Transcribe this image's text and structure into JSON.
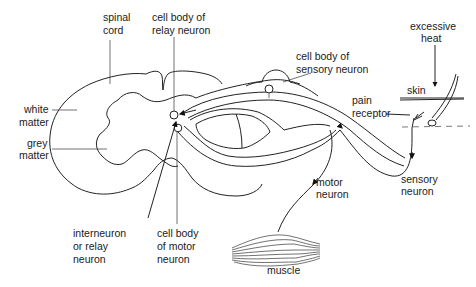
{
  "diagram": {
    "labels": {
      "spinal_cord": [
        "spinal",
        "cord"
      ],
      "cell_body_relay": [
        "cell body of",
        "relay neuron"
      ],
      "cell_body_sensory": [
        "cell body of",
        "sensory neuron"
      ],
      "excessive_heat": [
        "excessive",
        "heat"
      ],
      "skin": "skin",
      "pain_receptor": [
        "pain",
        "receptor"
      ],
      "white_matter": [
        "white",
        "matter"
      ],
      "grey_matter": [
        "grey",
        "matter"
      ],
      "interneuron": [
        "interneuron",
        "or relay",
        "neuron"
      ],
      "cell_body_motor": [
        "cell body",
        "of motor",
        "neuron"
      ],
      "motor_neuron": [
        "motor",
        "neuron"
      ],
      "sensory_neuron": [
        "sensory",
        "neuron"
      ],
      "muscle": "muscle"
    }
  }
}
